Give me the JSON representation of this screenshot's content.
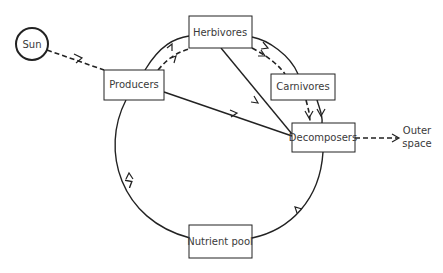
{
  "diagram": {
    "title": "",
    "nodes": {
      "sun": {
        "label": "Sun",
        "shape": "circle"
      },
      "producers": {
        "label": "Producers"
      },
      "herbivores": {
        "label": "Herbivores"
      },
      "carnivores": {
        "label": "Carnivores"
      },
      "decomposers": {
        "label": "Decomposers"
      },
      "nutrient_pool": {
        "label": "Nutrient pool"
      },
      "outer_space": {
        "label_line1": "Outer",
        "label_line2": "space",
        "shape": "text"
      }
    },
    "edges": [
      {
        "from": "sun",
        "to": "producers",
        "style": "dashed",
        "meaning": "energy"
      },
      {
        "from": "producers",
        "to": "herbivores",
        "style": "solid",
        "meaning": "nutrients"
      },
      {
        "from": "producers",
        "to": "herbivores",
        "style": "dashed",
        "meaning": "energy"
      },
      {
        "from": "herbivores",
        "to": "carnivores",
        "style": "solid"
      },
      {
        "from": "herbivores",
        "to": "carnivores",
        "style": "dashed"
      },
      {
        "from": "herbivores",
        "to": "decomposers",
        "style": "solid"
      },
      {
        "from": "producers",
        "to": "decomposers",
        "style": "solid"
      },
      {
        "from": "carnivores",
        "to": "decomposers",
        "style": "solid"
      },
      {
        "from": "carnivores",
        "to": "decomposers",
        "style": "dashed"
      },
      {
        "from": "decomposers",
        "to": "outer_space",
        "style": "dashed"
      },
      {
        "from": "decomposers",
        "to": "nutrient_pool",
        "style": "solid"
      },
      {
        "from": "nutrient_pool",
        "to": "producers",
        "style": "solid"
      }
    ],
    "colors": {
      "line": "#222222",
      "text": "#3a3a3a",
      "background": "#ffffff"
    }
  }
}
